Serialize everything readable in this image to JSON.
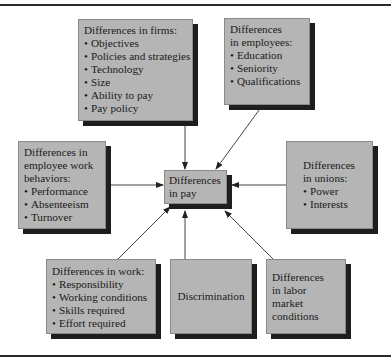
{
  "diagram": {
    "center": {
      "label": "Differences\nin pay"
    },
    "boxes": {
      "firms": {
        "title": "Differences in firms:",
        "items": [
          "Objectives",
          "Policies and strategies",
          "Technology",
          "Size",
          "Ability to pay",
          "Pay policy"
        ]
      },
      "employees": {
        "title": "Differences\nin employees:",
        "items": [
          "Education",
          "Seniority",
          "Qualifications"
        ]
      },
      "behaviors": {
        "title": "Differences in\nemployee work\nbehaviors:",
        "items": [
          "Performance",
          "Absenteeism",
          "Turnover"
        ]
      },
      "unions": {
        "title": "Differences\nin unions:",
        "items": [
          "Power",
          "Interests"
        ]
      },
      "work": {
        "title": "Differences in work:",
        "items": [
          "Responsibility",
          "Working conditions",
          "Skills required",
          "Effort required"
        ]
      },
      "discrimination": {
        "title": "Discrimination"
      },
      "labor_market": {
        "title": "Differences\nin labor market\nconditions"
      }
    },
    "colors": {
      "box_fill": "#b5b5b5",
      "box_shadow": "#1e1e1e",
      "arrow": "#333333"
    }
  }
}
